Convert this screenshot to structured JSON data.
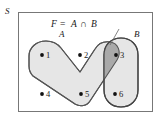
{
  "figure": {
    "name": "venn-diagram-intersection",
    "universe_label": "S",
    "formula": {
      "left": "F",
      "equals": "=",
      "set_a": "A",
      "operator": "∩",
      "set_b": "B",
      "full": "F = A ∩ B"
    },
    "sets": [
      {
        "id": "A",
        "label": "A",
        "fill": "#e6e6e6",
        "stroke": "#555555"
      },
      {
        "id": "B",
        "label": "B",
        "fill": "#e6e6e6",
        "stroke": "#444444"
      }
    ],
    "intersection": {
      "label": "F",
      "fill": "#a9a9a9",
      "members": [
        "3"
      ]
    },
    "frame": {
      "stroke": "#777777",
      "fill": "#ffffff"
    },
    "elements": [
      {
        "name": "element-1",
        "label": "1",
        "x": 47,
        "y": 55,
        "in_a": true,
        "in_b": false
      },
      {
        "name": "element-2",
        "label": "2",
        "x": 85,
        "y": 55,
        "in_a": true,
        "in_b": false
      },
      {
        "name": "element-3",
        "label": "3",
        "x": 121,
        "y": 55,
        "in_a": true,
        "in_b": true
      },
      {
        "name": "element-4",
        "label": "4",
        "x": 47,
        "y": 94,
        "in_a": false,
        "in_b": false
      },
      {
        "name": "element-5",
        "label": "5",
        "x": 86,
        "y": 94,
        "in_a": true,
        "in_b": false
      },
      {
        "name": "element-6",
        "label": "6",
        "x": 120,
        "y": 94,
        "in_a": false,
        "in_b": true
      }
    ]
  }
}
